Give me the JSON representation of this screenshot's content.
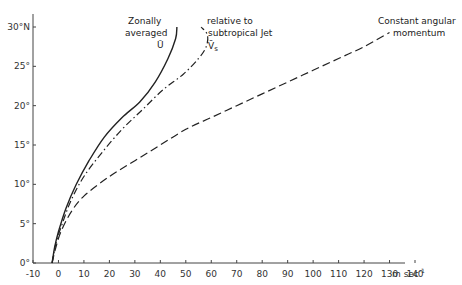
{
  "chart_data": {
    "type": "line",
    "title": "",
    "xlabel": "m sec⁻¹",
    "ylabel": "",
    "xlim": [
      -10,
      140
    ],
    "ylim": [
      0,
      30
    ],
    "grid": false,
    "legend_position": "none (inline curve annotations)",
    "x_ticks": [
      -10,
      0,
      10,
      20,
      30,
      40,
      50,
      60,
      70,
      80,
      90,
      100,
      110,
      120,
      130,
      140
    ],
    "x_tick_labels": [
      "-10",
      "0",
      "10",
      "20",
      "30",
      "40",
      "50",
      "60",
      "70",
      "80",
      "90",
      "100",
      "110",
      "120",
      "130",
      "140"
    ],
    "x_unit_label": "m sec⁻¹",
    "y_ticks": [
      0,
      5,
      10,
      15,
      20,
      25,
      30
    ],
    "y_tick_labels": [
      "0°",
      "5°",
      "10°",
      "15°",
      "20°",
      "25°",
      "30°N"
    ],
    "series": [
      {
        "name": "Zonally averaged Ū",
        "style": "solid",
        "points": [
          [
            -2.5,
            0
          ],
          [
            -1.5,
            2
          ],
          [
            0,
            4
          ],
          [
            3,
            7
          ],
          [
            7,
            10
          ],
          [
            12,
            13
          ],
          [
            18,
            16
          ],
          [
            25,
            18.5
          ],
          [
            32,
            20.5
          ],
          [
            38,
            23
          ],
          [
            43,
            26
          ],
          [
            46,
            28.5
          ],
          [
            46.5,
            30
          ]
        ]
      },
      {
        "name": "relative to subtropical Jet V̄s",
        "style": "dash-dot",
        "points": [
          [
            -2.5,
            0
          ],
          [
            -1,
            2.5
          ],
          [
            1.5,
            5
          ],
          [
            5,
            8
          ],
          [
            10,
            11
          ],
          [
            17,
            14
          ],
          [
            25,
            17
          ],
          [
            33,
            19.5
          ],
          [
            41,
            22
          ],
          [
            49,
            24
          ],
          [
            55,
            26
          ],
          [
            58,
            27.5
          ],
          [
            58.5,
            29
          ],
          [
            56,
            30
          ]
        ]
      },
      {
        "name": "Constant angular momentum",
        "style": "dashed",
        "points": [
          [
            -2.5,
            0
          ],
          [
            -1,
            2
          ],
          [
            1,
            4
          ],
          [
            5,
            6.5
          ],
          [
            10,
            8.5
          ],
          [
            20,
            11
          ],
          [
            30,
            13
          ],
          [
            40,
            15
          ],
          [
            50,
            17
          ],
          [
            60,
            18.5
          ],
          [
            70,
            20
          ],
          [
            80,
            21.5
          ],
          [
            90,
            23
          ],
          [
            100,
            24.5
          ],
          [
            110,
            26
          ],
          [
            120,
            27.5
          ],
          [
            130,
            29.3
          ]
        ]
      }
    ],
    "annotations": [
      {
        "text_lines": [
          "Zonally",
          "averaged",
          "Ū"
        ],
        "target_series": "Zonally averaged Ū"
      },
      {
        "text_lines": [
          "relative to",
          "subtropical  Jet",
          "V̄s"
        ],
        "target_series": "relative to subtropical Jet V̄s"
      },
      {
        "text_lines": [
          "Constant angular",
          "momentum"
        ],
        "target_series": "Constant angular momentum"
      }
    ]
  },
  "labels": {
    "zonal_line1": "Zonally",
    "zonal_line2": "averaged",
    "zonal_line3": "Ū",
    "jet_line1": "relative to",
    "jet_line2": "subtropical  Jet",
    "jet_symbol": "V̄",
    "jet_subscript": "s",
    "cam_line1": "Constant angular",
    "cam_line2": "momentum",
    "x_unit": "m sec",
    "x_unit_exp": "-1"
  },
  "colors": {
    "line": "#222222",
    "axis": "#444444",
    "text": "#333333",
    "background": "#ffffff"
  }
}
